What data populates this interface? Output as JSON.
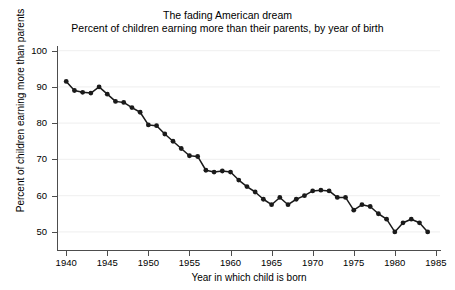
{
  "chart_data": {
    "type": "line",
    "title": "The fading American dream",
    "subtitle": "Percent of children earning more than their parents, by year of birth",
    "xlabel": "Year in which child is born",
    "ylabel": "Percent of children earning more than parents",
    "xlim": [
      1939,
      1985.5
    ],
    "ylim": [
      45,
      101
    ],
    "xticks": [
      1940,
      1945,
      1950,
      1955,
      1960,
      1965,
      1970,
      1975,
      1980,
      1985
    ],
    "yticks": [
      50,
      60,
      70,
      80,
      90,
      100
    ],
    "grid": "horizontal",
    "legend": "none",
    "marker": "filled-circle",
    "line_color": "#1a1a1a",
    "marker_color": "#1a1a1a",
    "grid_color": "#f2f2f2",
    "axis_color": "#4d4d4d",
    "x": [
      1940,
      1941,
      1942,
      1943,
      1944,
      1945,
      1946,
      1947,
      1948,
      1949,
      1950,
      1951,
      1952,
      1953,
      1954,
      1955,
      1956,
      1957,
      1958,
      1959,
      1960,
      1961,
      1962,
      1963,
      1964,
      1965,
      1966,
      1967,
      1968,
      1969,
      1970,
      1971,
      1972,
      1973,
      1974,
      1975,
      1976,
      1977,
      1978,
      1979,
      1980,
      1981,
      1982,
      1983,
      1984
    ],
    "values": [
      91.5,
      89.0,
      88.5,
      88.3,
      90.0,
      88.0,
      86.0,
      85.7,
      84.3,
      83.0,
      79.5,
      79.3,
      77.0,
      75.0,
      73.0,
      71.0,
      70.8,
      67.0,
      66.5,
      66.8,
      66.5,
      64.3,
      62.5,
      61.0,
      59.0,
      57.5,
      59.5,
      57.5,
      59.0,
      60.0,
      61.3,
      61.5,
      61.3,
      59.5,
      59.5,
      56.0,
      57.5,
      57.0,
      55.0,
      53.5,
      50.0,
      52.5,
      53.5,
      52.5,
      50.0
    ],
    "series_name": "Percent of children earning more than their parents"
  },
  "axis": {
    "y_tick_labels": [
      "100",
      "90",
      "80",
      "70",
      "60",
      "50"
    ],
    "x_tick_labels": [
      "1940",
      "1945",
      "1950",
      "1955",
      "1960",
      "1965",
      "1970",
      "1975",
      "1980",
      "1985"
    ]
  }
}
